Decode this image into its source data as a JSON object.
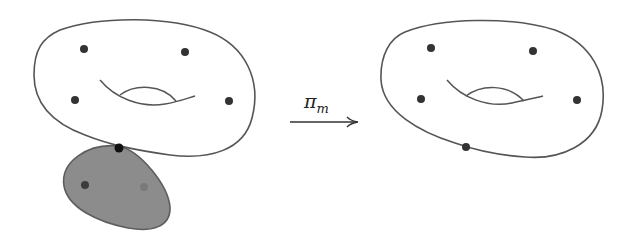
{
  "diagram": {
    "colors": {
      "background": "#ffffff",
      "outline": "#555555",
      "dot": "#333333",
      "node_dot": "#111111",
      "blob_fill": "#8c8c8c",
      "blob_stroke": "#5e5e5e",
      "blob_dot_dark": "#3c3c3c",
      "blob_dot_light": "#7a7a7a"
    },
    "left_surface": {
      "type": "genus-one torus with marked points",
      "marked_points": 4,
      "node": "attachment node to bubble component"
    },
    "bubble": {
      "type": "rational (genus-zero) component, shaded",
      "marked_points": 2
    },
    "arrow": {
      "label_main": "π",
      "label_sub": "m"
    },
    "right_surface": {
      "type": "genus-one torus with marked points after stabilization",
      "marked_points": 5
    }
  }
}
